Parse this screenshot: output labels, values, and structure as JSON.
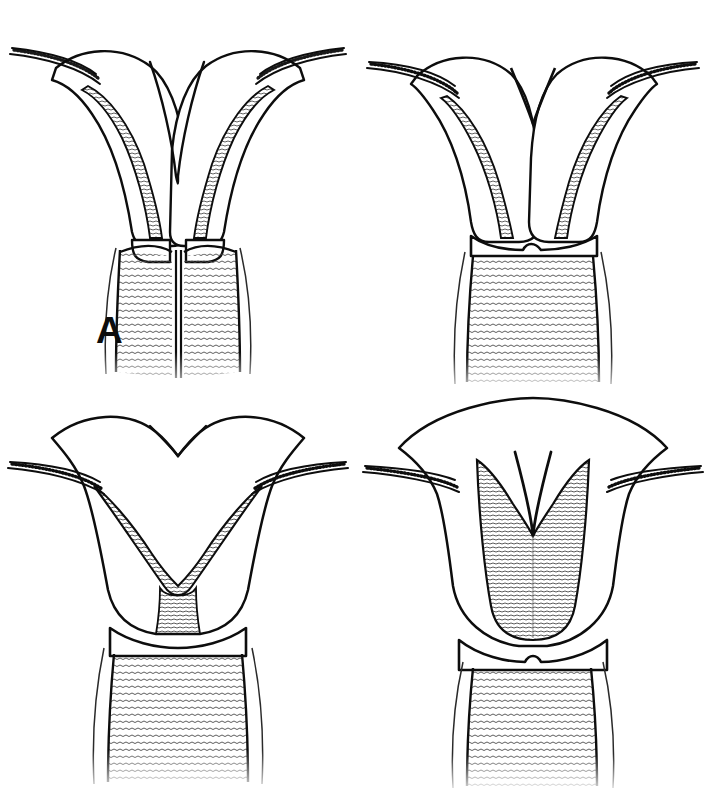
{
  "figure": {
    "background_color": "#ffffff",
    "ink_color": "#0d0d0d",
    "width": 711,
    "height": 796,
    "layout": "2x2 grid of line-art anatomical drawings",
    "style": "pen-and-ink stipple / hatched medical illustration",
    "panel_count": 4
  },
  "panels": [
    {
      "id": "a",
      "label": "A",
      "label_position": {
        "x": 96,
        "y": 312
      },
      "grid": {
        "row": 1,
        "col": 1
      },
      "anatomy": "uterus didelphys",
      "features": {
        "fundus": "two entirely separate, widely divergent uterine horns with no common fundus",
        "cavities": 2,
        "cervix": "double cervix (didelphic)",
        "vagina": "longitudinal vaginal septum dividing the vaginal canal",
        "fallopian_tubes": "one tube arising from the apex of each horn, directed laterally",
        "shading": "fine horizontal hatching in the endometrial cavities and vaginal rugae"
      }
    },
    {
      "id": "b",
      "label": "B",
      "label_position": {
        "x": 455,
        "y": 310
      },
      "grid": {
        "row": 1,
        "col": 2
      },
      "anatomy": "bicornuate uterus (unicollis)",
      "features": {
        "fundus": "deep external fundal cleft separating two horns that converge low in the corpus",
        "cavities": 2,
        "cervix": "single cervix",
        "vagina": "single vaginal canal with horizontal rugae",
        "fallopian_tubes": "one tube arising from each horn apex, directed laterally",
        "shading": "hatched endometrial linings converging above the internal os"
      }
    },
    {
      "id": "c",
      "label": "C",
      "label_position": {
        "x": 100,
        "y": 672
      },
      "grid": {
        "row": 2,
        "col": 1
      },
      "anatomy": "arcuate uterus",
      "features": {
        "fundus": "broad, gently concave (saddle-shaped) fundal contour",
        "cavities": 1,
        "cervix": "single cervix",
        "vagina": "single vaginal canal with horizontal rugae",
        "fallopian_tubes": "one tube arising from each cornu, directed laterally",
        "shading": "wide V-shaped hatched endometrial cavity with a shallow midline indentation"
      }
    },
    {
      "id": "d",
      "label": "D",
      "label_position": {
        "x": 445,
        "y": 668
      },
      "grid": {
        "row": 2,
        "col": 2
      },
      "anatomy": "septate uterus",
      "features": {
        "fundus": "smooth, convex (normal) external fundal contour",
        "cavities": 2,
        "cervix": "single cervix",
        "vagina": "single vaginal canal with horizontal rugae",
        "fallopian_tubes": "one tube arising from each cornu, directed laterally",
        "shading": "central fibrous septum descending from the fundus dividing the hatched cavity into two"
      }
    }
  ],
  "legend": {
    "a_caption": "A",
    "b_caption": "B",
    "c_caption": "C",
    "d_caption": "D"
  }
}
